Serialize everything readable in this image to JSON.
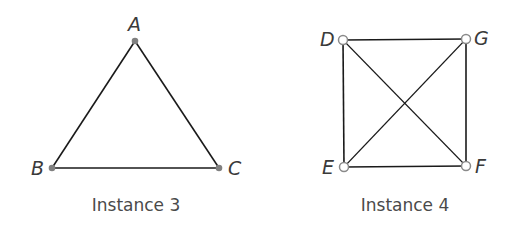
{
  "figures": [
    {
      "caption": "Instance 3",
      "vertices": [
        {
          "label": "A",
          "x": 135,
          "y": 41,
          "style": "filled"
        },
        {
          "label": "B",
          "x": 52,
          "y": 168,
          "style": "filled"
        },
        {
          "label": "C",
          "x": 219,
          "y": 168,
          "style": "filled"
        }
      ],
      "edges": [
        [
          "A",
          "B"
        ],
        [
          "A",
          "C"
        ],
        [
          "B",
          "C"
        ]
      ]
    },
    {
      "caption": "Instance 4",
      "vertices": [
        {
          "label": "D",
          "x": 343,
          "y": 40,
          "style": "open"
        },
        {
          "label": "G",
          "x": 466,
          "y": 39,
          "style": "open"
        },
        {
          "label": "E",
          "x": 344,
          "y": 167,
          "style": "open"
        },
        {
          "label": "F",
          "x": 466,
          "y": 166,
          "style": "open"
        }
      ],
      "edges": [
        [
          "D",
          "G"
        ],
        [
          "D",
          "E"
        ],
        [
          "G",
          "F"
        ],
        [
          "E",
          "F"
        ],
        [
          "D",
          "F"
        ],
        [
          "G",
          "E"
        ]
      ]
    }
  ],
  "colors": {
    "edge": "#1a1a1a",
    "vertex_fill": "#808080",
    "vertex_open_stroke": "#8a8a8a"
  }
}
